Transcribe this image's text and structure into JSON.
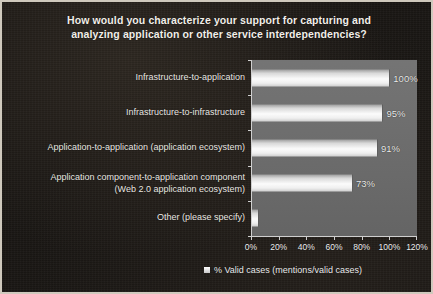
{
  "chart_data": {
    "type": "bar",
    "orientation": "horizontal",
    "title": "How would you characterize your support for capturing and analyzing application or other service interdependencies?",
    "title_lines": [
      "How would you characterize your support for capturing and",
      "analyzing application or other service interdependencies?"
    ],
    "categories": [
      "Infrastructure-to-application",
      "Infrastructure-to-infrastructure",
      "Application-to-application (application ecosystem)",
      "Application component-to-application component\n(Web 2.0 application ecosystem)",
      "Other (please specify)"
    ],
    "values": [
      100,
      95,
      91,
      73,
      5
    ],
    "value_labels": [
      "100%",
      "95%",
      "91%",
      "73%",
      ""
    ],
    "series": [
      {
        "name": "% Valid cases (mentions/valid cases)",
        "values": [
          100,
          95,
          91,
          73,
          5
        ]
      }
    ],
    "xlabel": "",
    "ylabel": "",
    "xlim": [
      0,
      120
    ],
    "xticks": [
      0,
      20,
      40,
      60,
      80,
      100,
      120
    ],
    "xtick_labels": [
      "0%",
      "20%",
      "40%",
      "60%",
      "80%",
      "100%",
      "120%"
    ],
    "grid": false,
    "legend": {
      "position": "bottom",
      "entries": [
        "% Valid cases (mentions/valid cases)"
      ]
    },
    "colors": {
      "background": "#1a1714",
      "plot_area": "#6d6d6d",
      "bar_fill": "#f5f5f5",
      "text": "#eeeeee",
      "frame_border": "#cfc9bd"
    }
  }
}
